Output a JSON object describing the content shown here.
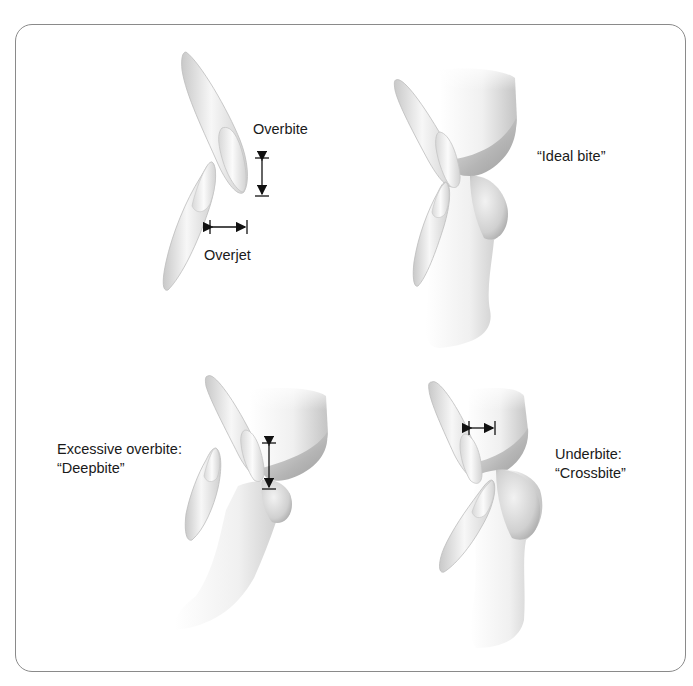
{
  "figure": {
    "panels": [
      {
        "id": "normal-measurements",
        "labels": [
          "Overbite",
          "Overjet"
        ]
      },
      {
        "id": "ideal-bite",
        "labels": [
          "“Ideal bite”"
        ]
      },
      {
        "id": "deepbite",
        "labels": [
          "Excessive overbite:",
          "“Deepbite”"
        ]
      },
      {
        "id": "crossbite",
        "labels": [
          "Underbite:",
          "“Crossbite”"
        ]
      }
    ],
    "colors": {
      "frame": "#8a8a8a",
      "tooth_light": "#f4f4f4",
      "tooth_shade": "#bdbdbd",
      "gum_light": "#f2f2f2",
      "gum_shade": "#a8a8a8",
      "arrow": "#111111",
      "text": "#1a1a1a"
    }
  }
}
